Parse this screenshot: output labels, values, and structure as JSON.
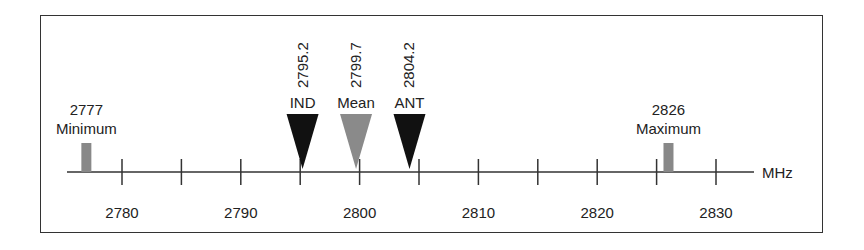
{
  "chart_data": {
    "type": "number-line",
    "unit": "MHz",
    "axis": {
      "min": 2773,
      "max": 2834,
      "major_ticks": [
        2780,
        2790,
        2800,
        2810,
        2820,
        2830
      ],
      "minor_ticks": [
        2785,
        2795,
        2805,
        2815,
        2825
      ]
    },
    "tick_labels": [
      "2780",
      "2790",
      "2800",
      "2810",
      "2820",
      "2830"
    ],
    "markers": [
      {
        "name": "Minimum",
        "value": 2777,
        "value_label": "2777",
        "shape": "bar",
        "color": "#888888"
      },
      {
        "name": "IND",
        "value": 2795.2,
        "value_label": "2795.2",
        "shape": "triangle",
        "color": "#111111"
      },
      {
        "name": "Mean",
        "value": 2799.7,
        "value_label": "2799.7",
        "shape": "triangle",
        "color": "#8a8a8a"
      },
      {
        "name": "ANT",
        "value": 2804.2,
        "value_label": "2804.2",
        "shape": "triangle",
        "color": "#111111"
      },
      {
        "name": "Maximum",
        "value": 2826,
        "value_label": "2826",
        "shape": "bar",
        "color": "#888888"
      }
    ]
  },
  "unit_label": "MHz"
}
